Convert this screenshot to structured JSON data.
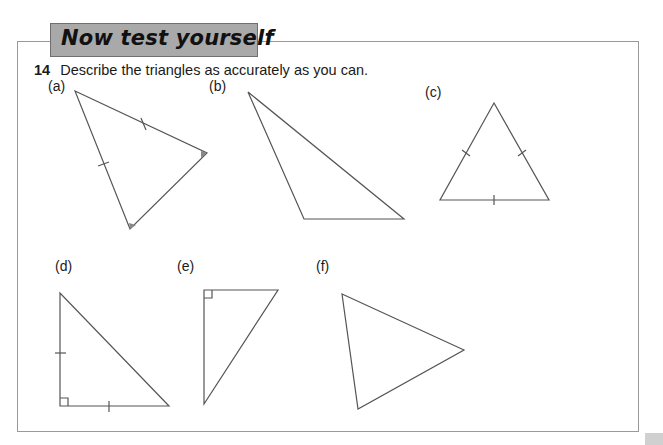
{
  "banner": {
    "title": "Now test yourself"
  },
  "question": {
    "number": "14",
    "text": "Describe the triangles as accurately as you can."
  },
  "triangles": [
    {
      "label": "(a)",
      "description": "isosceles triangle, two equal sides marked, two equal angles shaded"
    },
    {
      "label": "(b)",
      "description": "obtuse scalene triangle"
    },
    {
      "label": "(c)",
      "description": "equilateral triangle, all three sides marked equal"
    },
    {
      "label": "(d)",
      "description": "right-angled isosceles triangle, two legs marked equal"
    },
    {
      "label": "(e)",
      "description": "right-angled triangle"
    },
    {
      "label": "(f)",
      "description": "scalene triangle"
    }
  ],
  "colors": {
    "banner_bg": "#a9a9a9",
    "line": "#555555",
    "frame": "#9a9a9a"
  }
}
